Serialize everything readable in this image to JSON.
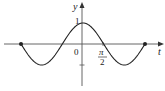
{
  "chart_data": {
    "type": "line",
    "title": "",
    "function": "y = cos t",
    "xlabel": "t",
    "ylabel": "y",
    "x_range": [
      -4.712,
      4.712
    ],
    "ylim": [
      -1,
      1
    ],
    "grid": false,
    "legend": null,
    "tick_labels": {
      "x": [
        {
          "value": 1.5708,
          "label_num": "π",
          "label_den": "2"
        }
      ],
      "y": [
        {
          "value": 1,
          "label": "1"
        }
      ],
      "origin": "0"
    },
    "endpoints": [
      {
        "x": -4.712,
        "y": 0
      },
      {
        "x": 4.712,
        "y": 0
      }
    ],
    "x": [
      -4.712,
      -3.927,
      -3.1416,
      -2.356,
      -1.5708,
      -0.785,
      0,
      0.785,
      1.5708,
      2.356,
      3.1416,
      3.927,
      4.712
    ],
    "values": [
      0,
      -0.707,
      -1,
      -0.707,
      0,
      0.707,
      1,
      0.707,
      0,
      -0.707,
      -1,
      -0.707,
      0
    ]
  },
  "labels": {
    "y_axis": "y",
    "x_axis": "t",
    "origin": "0",
    "one": "1",
    "pi": "π",
    "two": "2"
  },
  "colors": {
    "curve": "#222222",
    "axis": "#555555"
  }
}
